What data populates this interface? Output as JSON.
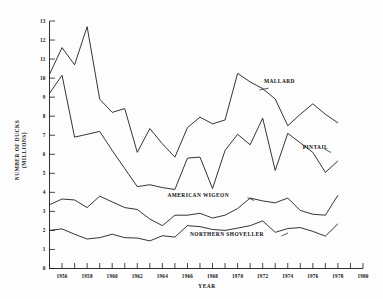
{
  "chart_data": {
    "type": "line",
    "title": "",
    "xlabel": "YEAR",
    "ylabel": "NUMBER OF DUCKS (MILLIONS)",
    "xlim": [
      1955,
      1980
    ],
    "ylim": [
      0,
      13
    ],
    "grid": false,
    "legend_position": "inline-annotations",
    "x_ticks_every": 1,
    "x_tick_labels": [
      "1956",
      "1958",
      "1960",
      "1962",
      "1964",
      "1966",
      "1968",
      "1970",
      "1972",
      "1974",
      "1976",
      "1978",
      "1980"
    ],
    "x_tick_values": [
      1956,
      1958,
      1960,
      1962,
      1964,
      1966,
      1968,
      1970,
      1972,
      1974,
      1976,
      1978,
      1980
    ],
    "y_tick_labels": [
      "0",
      "1",
      "2",
      "3",
      "4",
      "5",
      "6",
      "7",
      "8",
      "9",
      "10",
      "11",
      "12",
      "13"
    ],
    "y_tick_values": [
      0,
      1,
      2,
      3,
      4,
      5,
      6,
      7,
      8,
      9,
      10,
      11,
      12,
      13
    ],
    "x": [
      1955,
      1956,
      1957,
      1958,
      1959,
      1960,
      1961,
      1962,
      1963,
      1964,
      1965,
      1966,
      1967,
      1968,
      1969,
      1970,
      1971,
      1972,
      1973,
      1974,
      1975,
      1976,
      1977,
      1978
    ],
    "series": [
      {
        "name": "MALLARD",
        "label": "MALLARD",
        "label_x": 1972.1,
        "label_y": 9.75,
        "values": [
          10.2,
          11.6,
          10.7,
          12.7,
          8.9,
          8.2,
          8.4,
          6.1,
          7.35,
          6.55,
          5.85,
          7.4,
          7.95,
          7.6,
          7.8,
          10.25,
          9.8,
          9.45,
          8.9,
          7.5,
          8.1,
          8.65,
          8.1,
          7.65
        ]
      },
      {
        "name": "PINTAIL",
        "label": "PINTAIL",
        "label_x": 1975.2,
        "label_y": 6.3,
        "values": [
          9.2,
          10.15,
          6.9,
          7.05,
          7.2,
          6.2,
          5.25,
          4.3,
          4.4,
          4.25,
          4.15,
          5.8,
          5.85,
          4.2,
          6.2,
          7.05,
          6.5,
          7.9,
          5.15,
          7.1,
          6.6,
          6.1,
          5.05,
          5.65
        ]
      },
      {
        "name": "AMERICAN WIGEON",
        "label": "AMERICAN WIGEON",
        "label_x": 1964.4,
        "label_y": 3.75,
        "values": [
          3.35,
          3.65,
          3.6,
          3.2,
          3.8,
          3.5,
          3.2,
          3.1,
          2.6,
          2.25,
          2.8,
          2.8,
          2.9,
          2.65,
          2.8,
          3.15,
          3.7,
          3.55,
          3.45,
          3.7,
          3.05,
          2.85,
          2.8,
          3.85
        ]
      },
      {
        "name": "NORTHERN SHOVELLER",
        "label": "NORTHERN SHOVELLER",
        "label_x": 1966.2,
        "label_y": 1.72,
        "values": [
          2.0,
          2.08,
          1.8,
          1.55,
          1.62,
          1.8,
          1.62,
          1.6,
          1.45,
          1.72,
          1.65,
          2.25,
          2.2,
          2.05,
          2.0,
          2.12,
          2.25,
          2.5,
          1.9,
          2.1,
          2.15,
          1.95,
          1.7,
          2.35
        ]
      }
    ]
  },
  "figure": {
    "y_axis_title": "NUMBER OF DUCKS (MILLIONS)",
    "y_axis_title_line1": "NUMBER OF DUCKS",
    "y_axis_title_line2": "(MILLIONS)",
    "x_axis_title": "YEAR"
  }
}
